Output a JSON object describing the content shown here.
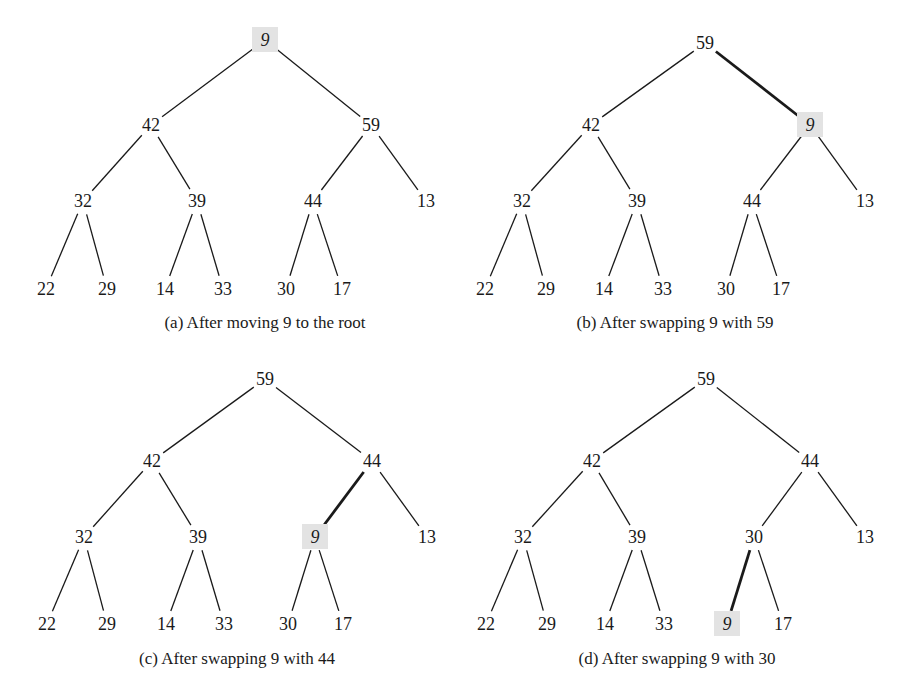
{
  "figure": {
    "highlight_color": "#e3e3e3",
    "panels": [
      {
        "id": "a",
        "caption": "(a) After moving 9 to the root",
        "caption_pos": [
          265,
          328
        ],
        "nodes": [
          {
            "id": "n0",
            "value": "9",
            "x": 265,
            "y": 40,
            "highlight": true
          },
          {
            "id": "n1",
            "value": "42",
            "x": 151,
            "y": 125
          },
          {
            "id": "n2",
            "value": "59",
            "x": 371,
            "y": 125
          },
          {
            "id": "n3",
            "value": "32",
            "x": 83,
            "y": 201
          },
          {
            "id": "n4",
            "value": "39",
            "x": 197,
            "y": 201
          },
          {
            "id": "n5",
            "value": "44",
            "x": 313,
            "y": 201
          },
          {
            "id": "n6",
            "value": "13",
            "x": 426,
            "y": 201
          },
          {
            "id": "n7",
            "value": "22",
            "x": 46,
            "y": 289
          },
          {
            "id": "n8",
            "value": "29",
            "x": 107,
            "y": 289
          },
          {
            "id": "n9",
            "value": "14",
            "x": 165,
            "y": 289
          },
          {
            "id": "n10",
            "value": "33",
            "x": 223,
            "y": 289
          },
          {
            "id": "n11",
            "value": "30",
            "x": 286,
            "y": 289
          },
          {
            "id": "n12",
            "value": "17",
            "x": 342,
            "y": 289
          }
        ],
        "edges": [
          {
            "from": "n0",
            "to": "n1"
          },
          {
            "from": "n0",
            "to": "n2"
          },
          {
            "from": "n1",
            "to": "n3"
          },
          {
            "from": "n1",
            "to": "n4"
          },
          {
            "from": "n2",
            "to": "n5"
          },
          {
            "from": "n2",
            "to": "n6"
          },
          {
            "from": "n3",
            "to": "n7"
          },
          {
            "from": "n3",
            "to": "n8"
          },
          {
            "from": "n4",
            "to": "n9"
          },
          {
            "from": "n4",
            "to": "n10"
          },
          {
            "from": "n5",
            "to": "n11"
          },
          {
            "from": "n5",
            "to": "n12"
          }
        ]
      },
      {
        "id": "b",
        "caption": "(b) After swapping 9 with 59",
        "caption_pos": [
          675,
          328
        ],
        "nodes": [
          {
            "id": "n0",
            "value": "59",
            "x": 705,
            "y": 43
          },
          {
            "id": "n1",
            "value": "42",
            "x": 591,
            "y": 125
          },
          {
            "id": "n2",
            "value": "9",
            "x": 810,
            "y": 125,
            "highlight": true
          },
          {
            "id": "n3",
            "value": "32",
            "x": 522,
            "y": 201
          },
          {
            "id": "n4",
            "value": "39",
            "x": 637,
            "y": 201
          },
          {
            "id": "n5",
            "value": "44",
            "x": 752,
            "y": 201
          },
          {
            "id": "n6",
            "value": "13",
            "x": 865,
            "y": 201
          },
          {
            "id": "n7",
            "value": "22",
            "x": 485,
            "y": 289
          },
          {
            "id": "n8",
            "value": "29",
            "x": 546,
            "y": 289
          },
          {
            "id": "n9",
            "value": "14",
            "x": 604,
            "y": 289
          },
          {
            "id": "n10",
            "value": "33",
            "x": 663,
            "y": 289
          },
          {
            "id": "n11",
            "value": "30",
            "x": 726,
            "y": 289
          },
          {
            "id": "n12",
            "value": "17",
            "x": 781,
            "y": 289
          }
        ],
        "edges": [
          {
            "from": "n0",
            "to": "n1"
          },
          {
            "from": "n0",
            "to": "n2",
            "bold": true
          },
          {
            "from": "n1",
            "to": "n3"
          },
          {
            "from": "n1",
            "to": "n4"
          },
          {
            "from": "n2",
            "to": "n5"
          },
          {
            "from": "n2",
            "to": "n6"
          },
          {
            "from": "n3",
            "to": "n7"
          },
          {
            "from": "n3",
            "to": "n8"
          },
          {
            "from": "n4",
            "to": "n9"
          },
          {
            "from": "n4",
            "to": "n10"
          },
          {
            "from": "n5",
            "to": "n11"
          },
          {
            "from": "n5",
            "to": "n12"
          }
        ]
      },
      {
        "id": "c",
        "caption": "(c) After swapping 9 with 44",
        "caption_pos": [
          237,
          664
        ],
        "nodes": [
          {
            "id": "n0",
            "value": "59",
            "x": 265,
            "y": 379
          },
          {
            "id": "n1",
            "value": "42",
            "x": 152,
            "y": 461
          },
          {
            "id": "n2",
            "value": "44",
            "x": 372,
            "y": 461
          },
          {
            "id": "n3",
            "value": "32",
            "x": 84,
            "y": 537
          },
          {
            "id": "n4",
            "value": "39",
            "x": 198,
            "y": 537
          },
          {
            "id": "n5",
            "value": "9",
            "x": 315,
            "y": 537,
            "highlight": true
          },
          {
            "id": "n6",
            "value": "13",
            "x": 427,
            "y": 537
          },
          {
            "id": "n7",
            "value": "22",
            "x": 47,
            "y": 624
          },
          {
            "id": "n8",
            "value": "29",
            "x": 107,
            "y": 624
          },
          {
            "id": "n9",
            "value": "14",
            "x": 166,
            "y": 624
          },
          {
            "id": "n10",
            "value": "33",
            "x": 224,
            "y": 624
          },
          {
            "id": "n11",
            "value": "30",
            "x": 288,
            "y": 624
          },
          {
            "id": "n12",
            "value": "17",
            "x": 343,
            "y": 624
          }
        ],
        "edges": [
          {
            "from": "n0",
            "to": "n1"
          },
          {
            "from": "n0",
            "to": "n2"
          },
          {
            "from": "n1",
            "to": "n3"
          },
          {
            "from": "n1",
            "to": "n4"
          },
          {
            "from": "n2",
            "to": "n5",
            "bold": true
          },
          {
            "from": "n2",
            "to": "n6"
          },
          {
            "from": "n3",
            "to": "n7"
          },
          {
            "from": "n3",
            "to": "n8"
          },
          {
            "from": "n4",
            "to": "n9"
          },
          {
            "from": "n4",
            "to": "n10"
          },
          {
            "from": "n5",
            "to": "n11"
          },
          {
            "from": "n5",
            "to": "n12"
          }
        ]
      },
      {
        "id": "d",
        "caption": "(d) After swapping 9 with 30",
        "caption_pos": [
          677,
          664
        ],
        "nodes": [
          {
            "id": "n0",
            "value": "59",
            "x": 706,
            "y": 379
          },
          {
            "id": "n1",
            "value": "42",
            "x": 592,
            "y": 461
          },
          {
            "id": "n2",
            "value": "44",
            "x": 810,
            "y": 461
          },
          {
            "id": "n3",
            "value": "32",
            "x": 523,
            "y": 537
          },
          {
            "id": "n4",
            "value": "39",
            "x": 637,
            "y": 537
          },
          {
            "id": "n5",
            "value": "30",
            "x": 754,
            "y": 537
          },
          {
            "id": "n6",
            "value": "13",
            "x": 865,
            "y": 537
          },
          {
            "id": "n7",
            "value": "22",
            "x": 486,
            "y": 624
          },
          {
            "id": "n8",
            "value": "29",
            "x": 547,
            "y": 624
          },
          {
            "id": "n9",
            "value": "14",
            "x": 605,
            "y": 624
          },
          {
            "id": "n10",
            "value": "33",
            "x": 664,
            "y": 624
          },
          {
            "id": "n11",
            "value": "9",
            "x": 727,
            "y": 624,
            "highlight": true
          },
          {
            "id": "n12",
            "value": "17",
            "x": 783,
            "y": 624
          }
        ],
        "edges": [
          {
            "from": "n0",
            "to": "n1"
          },
          {
            "from": "n0",
            "to": "n2"
          },
          {
            "from": "n1",
            "to": "n3"
          },
          {
            "from": "n1",
            "to": "n4"
          },
          {
            "from": "n2",
            "to": "n5"
          },
          {
            "from": "n2",
            "to": "n6"
          },
          {
            "from": "n3",
            "to": "n7"
          },
          {
            "from": "n3",
            "to": "n8"
          },
          {
            "from": "n4",
            "to": "n9"
          },
          {
            "from": "n4",
            "to": "n10"
          },
          {
            "from": "n5",
            "to": "n11",
            "bold": true
          },
          {
            "from": "n5",
            "to": "n12"
          }
        ]
      }
    ]
  }
}
